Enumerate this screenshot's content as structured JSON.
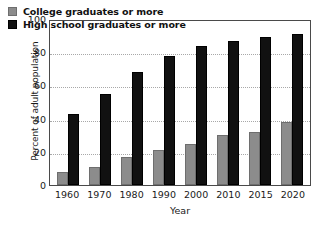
{
  "chart_data": {
    "type": "bar",
    "title": "",
    "xlabel": "Year",
    "ylabel": "Percent of adult population",
    "categories": [
      "1960",
      "1970",
      "1980",
      "1990",
      "2000",
      "2010",
      "2015",
      "2020"
    ],
    "series": [
      {
        "name": "College graduates or more",
        "color": "#8c8c8c",
        "values": [
          8,
          11,
          17,
          21,
          25,
          30,
          32,
          38
        ]
      },
      {
        "name": "High school graduates or more",
        "color": "#111111",
        "values": [
          43,
          55,
          68,
          78,
          84,
          87,
          89,
          91
        ]
      }
    ],
    "ylim": [
      0,
      100
    ],
    "yticks": [
      "0",
      "20",
      "40",
      "60",
      "80",
      "100"
    ],
    "grid": true,
    "grid_style": "dotted-horizontal",
    "legend_position": "top-left"
  },
  "axis": {
    "frame_color": "#4a4a4a",
    "grid_color": "#a8a8a8"
  }
}
